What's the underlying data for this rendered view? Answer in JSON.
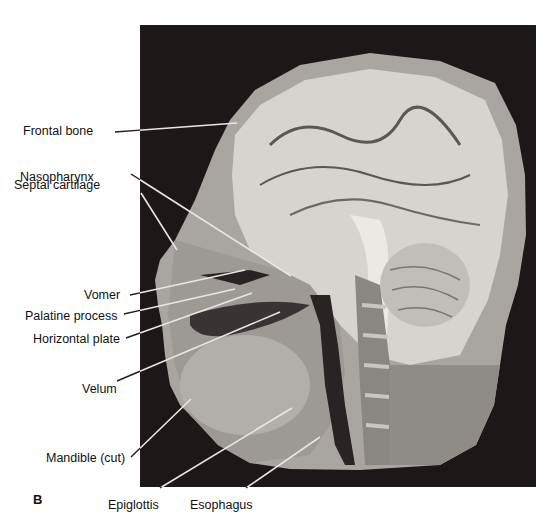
{
  "figure": {
    "panel_letter": "B",
    "colors": {
      "background": "#ffffff",
      "photo_background": "#1e1718",
      "tissue_light": "#d6d4cf",
      "tissue_mid": "#a9a6a1",
      "tissue_dark": "#6d6a66",
      "leader_line_light": "#e8e6e2",
      "leader_line_dark": "#222222"
    },
    "labels": [
      {
        "text": "Frontal bone",
        "x": 23,
        "y": 124,
        "ax": 115,
        "ay": 132,
        "bx": 237,
        "by": 123
      },
      {
        "text": "Nasopharynx",
        "x": 20,
        "y": 170,
        "ax": 131,
        "ay": 174,
        "bx": 291,
        "by": 276
      },
      {
        "text": "Septal cartilage",
        "x": 14,
        "y": 178,
        "ax": 141,
        "ay": 193,
        "bx": 177,
        "by": 250
      },
      {
        "text": "Vomer",
        "x": 84,
        "y": 288,
        "ax": 130,
        "ay": 295,
        "bx": 245,
        "by": 270
      },
      {
        "text": "Palatine process",
        "x": 25,
        "y": 309,
        "ax": 124,
        "ay": 314,
        "bx": 235,
        "by": 289
      },
      {
        "text": "Horizontal plate",
        "x": 33,
        "y": 332,
        "ax": 126,
        "ay": 338,
        "bx": 252,
        "by": 293
      },
      {
        "text": "Velum",
        "x": 82,
        "y": 382,
        "ax": 117,
        "ay": 381,
        "bx": 280,
        "by": 312
      },
      {
        "text": "Mandible (cut)",
        "x": 46,
        "y": 451,
        "ax": 131,
        "ay": 457,
        "bx": 191,
        "by": 399
      },
      {
        "text": "Epiglottis",
        "x": 108,
        "y": 498,
        "ax": 160,
        "ay": 488,
        "bx": 292,
        "by": 408
      },
      {
        "text": "Esophagus",
        "x": 190,
        "y": 498,
        "ax": 246,
        "ay": 488,
        "bx": 320,
        "by": 437
      }
    ]
  }
}
